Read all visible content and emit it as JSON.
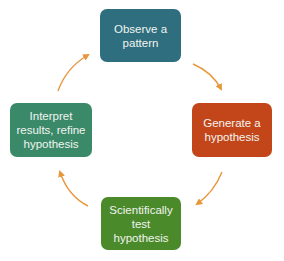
{
  "diagram": {
    "type": "cycle",
    "nodes": [
      {
        "id": "observe",
        "label": "Observe a\npattern",
        "color": "#2e6e7e"
      },
      {
        "id": "generate",
        "label": "Generate a\nhypothesis",
        "color": "#c2461a"
      },
      {
        "id": "test",
        "label": "Scientifically\ntest\nhypothesis",
        "color": "#4a8a2a"
      },
      {
        "id": "interpret",
        "label": "Interpret\nresults, refine\nhypothesis",
        "color": "#3a8a6a"
      }
    ],
    "edges": [
      {
        "from": "observe",
        "to": "generate"
      },
      {
        "from": "generate",
        "to": "test"
      },
      {
        "from": "test",
        "to": "interpret"
      },
      {
        "from": "interpret",
        "to": "observe"
      }
    ],
    "arrow_color": "#e8963a"
  }
}
